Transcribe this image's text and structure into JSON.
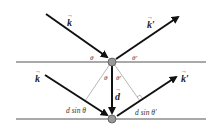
{
  "diagram": {
    "planes": [
      {
        "name": "upper-plane",
        "y": 62
      },
      {
        "name": "lower-plane",
        "y": 119
      }
    ],
    "atoms": [
      {
        "name": "upper-atom",
        "x": 112,
        "y": 62
      },
      {
        "name": "lower-atom",
        "x": 112,
        "y": 119
      }
    ],
    "labels": {
      "k_in_top": "k",
      "k_out_top": "k′",
      "k_in_bottom": "k",
      "k_out_bottom": "k′",
      "theta_left": "θ",
      "theta_right": "θ′",
      "theta_inner_left": "θ",
      "theta_inner_right": "θ′",
      "d_vector": "d",
      "path_left": "d sin θ",
      "path_right": "d sin θ′"
    },
    "colors": {
      "line": "#555555",
      "arrow": "#111111",
      "atom_fill": "#999999",
      "atom_stroke": "#555555",
      "thin_line": "#888888"
    }
  }
}
